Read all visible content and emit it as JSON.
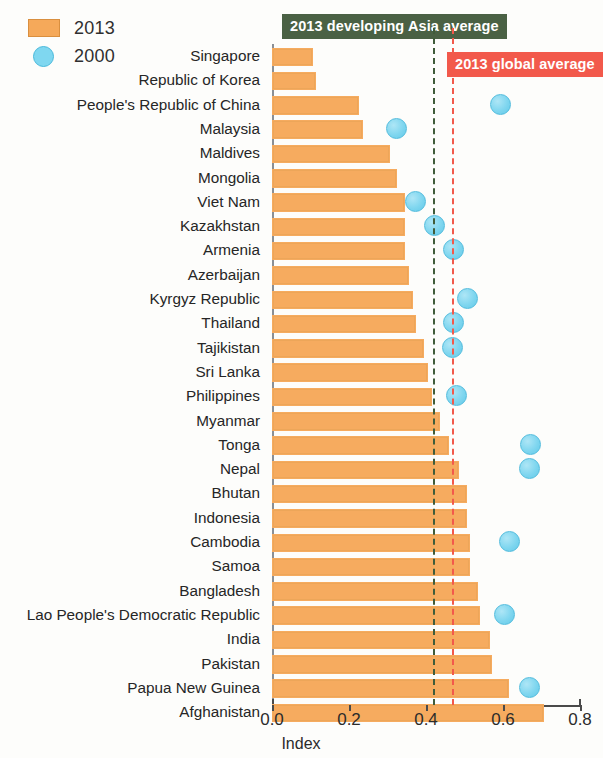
{
  "legend": {
    "items": [
      {
        "label": "2013",
        "marker": "bar-swatch",
        "color": "#f5a95a"
      },
      {
        "label": "2000",
        "marker": "circle-swatch",
        "color": "#7fd7f0"
      }
    ]
  },
  "banners": [
    {
      "id": "asia",
      "text": "2013 developing Asia average",
      "color": "#4a6144"
    },
    {
      "id": "global",
      "text": "2013 global average",
      "color": "#f2594b"
    }
  ],
  "axis": {
    "xlabel": "Index",
    "ticks": [
      "0.0",
      "0.2",
      "0.4",
      "0.6",
      "0.8"
    ],
    "tick_values": [
      0.0,
      0.2,
      0.4,
      0.6,
      0.8
    ]
  },
  "chart_data": {
    "type": "bar",
    "orientation": "horizontal",
    "title": "",
    "xlabel": "Index",
    "ylabel": "",
    "xlim": [
      0.0,
      0.8
    ],
    "grid": false,
    "legend_position": "top-left",
    "categories": [
      "Singapore",
      "Republic of Korea",
      "People's Republic of China",
      "Malaysia",
      "Maldives",
      "Mongolia",
      "Viet Nam",
      "Kazakhstan",
      "Armenia",
      "Azerbaijan",
      "Kyrgyz Republic",
      "Thailand",
      "Tajikistan",
      "Sri Lanka",
      "Philippines",
      "Myanmar",
      "Tonga",
      "Nepal",
      "Bhutan",
      "Indonesia",
      "Cambodia",
      "Samoa",
      "Bangladesh",
      "Lao People's Democratic Republic",
      "India",
      "Pakistan",
      "Papua New Guinea",
      "Afghanistan"
    ],
    "series": [
      {
        "name": "2013",
        "type": "bar",
        "color": "#f6ab5f",
        "values": [
          0.1,
          0.11,
          0.22,
          0.23,
          0.3,
          0.32,
          0.34,
          0.34,
          0.34,
          0.35,
          0.36,
          0.37,
          0.39,
          0.4,
          0.41,
          0.43,
          0.455,
          0.48,
          0.5,
          0.5,
          0.51,
          0.51,
          0.53,
          0.535,
          0.56,
          0.565,
          0.61,
          0.7
        ]
      },
      {
        "name": "2000",
        "type": "scatter",
        "color": "#7fd6ef",
        "values": [
          null,
          null,
          0.59,
          0.32,
          null,
          null,
          0.37,
          0.42,
          0.47,
          null,
          0.505,
          0.468,
          0.465,
          null,
          0.477,
          null,
          0.67,
          0.665,
          null,
          null,
          0.615,
          null,
          null,
          0.6,
          null,
          null,
          0.665,
          null
        ]
      }
    ],
    "reference_lines": [
      {
        "label": "2013 developing Asia average",
        "value": 0.418,
        "color": "#3f5c3a",
        "style": "dashed"
      },
      {
        "label": "2013 global average",
        "value": 0.468,
        "color": "#f2594b",
        "style": "dashed"
      }
    ]
  }
}
